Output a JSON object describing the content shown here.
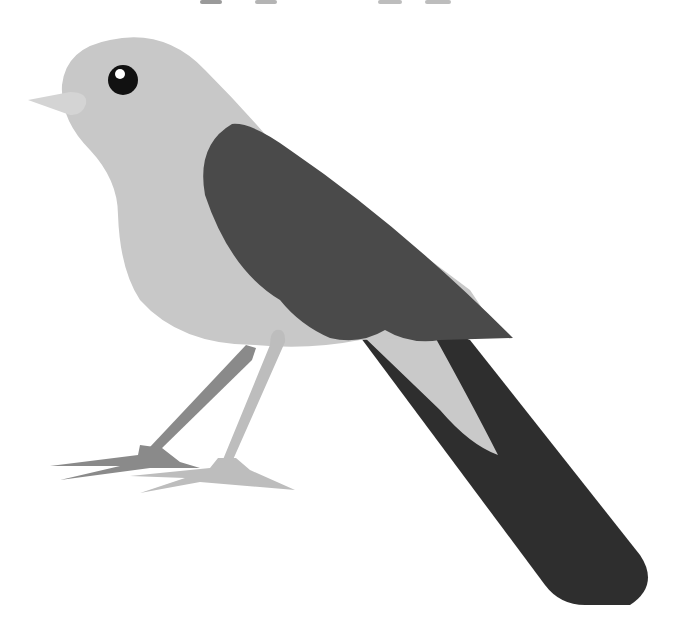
{
  "image": {
    "subject": "Stylized grayscale illustration of a perched bird with long dark tail",
    "colors": {
      "background": "#ffffff",
      "body": "#c8c8c8",
      "beak": "#d4d4d4",
      "wing": "#4a4a4a",
      "tail": "#2e2e2e",
      "tail_inner": "#c9c9c9",
      "leg_back": "#8a8a8a",
      "leg_front": "#bdbdbd",
      "eye": "#111111",
      "eye_highlight": "#ffffff",
      "top_marks": "#9a9a9a"
    },
    "parts": [
      "head",
      "eye",
      "beak",
      "body",
      "wing",
      "tail",
      "back-leg",
      "front-leg"
    ]
  }
}
